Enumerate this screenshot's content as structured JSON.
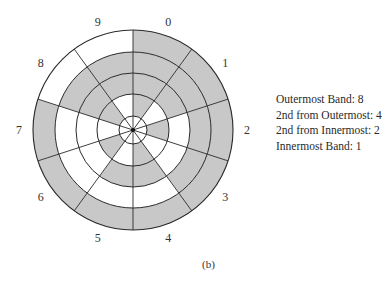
{
  "figure": {
    "caption": "(b)",
    "colors": {
      "shaded": "#c8c8c8",
      "unshaded": "#ffffff",
      "line": "#2a2a2a"
    },
    "geometry": {
      "center": [
        133,
        130
      ],
      "band_radii": [
        14,
        36,
        57,
        78,
        100
      ],
      "label_radius": 114,
      "sector_count": 10,
      "start_angle_deg": 0,
      "direction": "clockwise"
    },
    "bands": [
      {
        "name": "Outermost Band",
        "weight": 8,
        "inner_r": 78,
        "outer_r": 100
      },
      {
        "name": "2nd from Outermost",
        "weight": 4,
        "inner_r": 57,
        "outer_r": 78
      },
      {
        "name": "2nd from Innermost",
        "weight": 2,
        "inner_r": 36,
        "outer_r": 57
      },
      {
        "name": "Innermost Band",
        "weight": 1,
        "inner_r": 14,
        "outer_r": 36
      }
    ],
    "sectors": [
      {
        "label": "0",
        "value": 0,
        "white_bands": []
      },
      {
        "label": "1",
        "value": 1,
        "white_bands": [
          1
        ]
      },
      {
        "label": "2",
        "value": 2,
        "white_bands": [
          2
        ]
      },
      {
        "label": "3",
        "value": 3,
        "white_bands": [
          2,
          1
        ]
      },
      {
        "label": "4",
        "value": 4,
        "white_bands": [
          4
        ]
      },
      {
        "label": "5",
        "value": 5,
        "white_bands": [
          4,
          1
        ]
      },
      {
        "label": "6",
        "value": 6,
        "white_bands": [
          4,
          2
        ]
      },
      {
        "label": "7",
        "value": 7,
        "white_bands": [
          4,
          2,
          1
        ]
      },
      {
        "label": "8",
        "value": 8,
        "white_bands": [
          8
        ]
      },
      {
        "label": "9",
        "value": 9,
        "white_bands": [
          8,
          1
        ]
      }
    ]
  },
  "legend": {
    "lines": [
      "Outermost Band: 8",
      "2nd from Outermost: 4",
      "2nd from Innermost: 2",
      "Innermost Band: 1"
    ]
  }
}
